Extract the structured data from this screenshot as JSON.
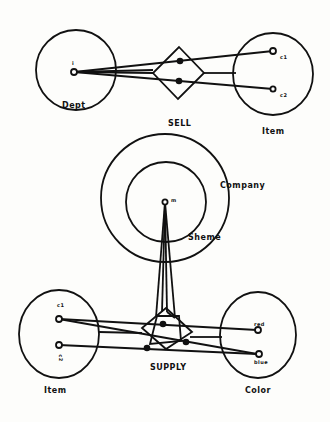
{
  "diagram": {
    "top": {
      "entity_left": {
        "label": "Dept",
        "instance": "i"
      },
      "relationship": {
        "label": "SELL"
      },
      "entity_right": {
        "label": "Item",
        "instances": [
          "c1",
          "c2"
        ]
      }
    },
    "middle": {
      "outer_label": "Company",
      "inner_label": "Sheme",
      "instance": "m"
    },
    "bottom": {
      "entity_left": {
        "label": "Item",
        "instances": [
          "c1",
          "c2"
        ]
      },
      "relationship": {
        "label": "SUPPLY"
      },
      "entity_right": {
        "label": "Color",
        "instances": [
          "red",
          "blue"
        ]
      }
    }
  }
}
